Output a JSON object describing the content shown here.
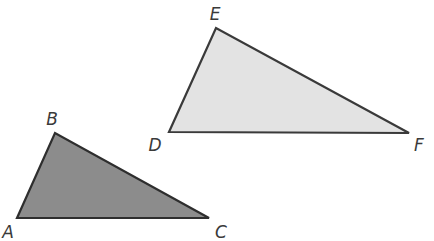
{
  "diagram": {
    "triangles": [
      {
        "name": "ABC",
        "fill": "#8c8c8c",
        "stroke": "#2e2e2e",
        "vertices": [
          {
            "label": "A",
            "x": 17,
            "y": 218,
            "lx": 8,
            "ly": 238,
            "anchor": "middle"
          },
          {
            "label": "B",
            "x": 55,
            "y": 133,
            "lx": 52,
            "ly": 125,
            "anchor": "middle"
          },
          {
            "label": "C",
            "x": 209,
            "y": 218,
            "lx": 221,
            "ly": 238,
            "anchor": "middle"
          }
        ]
      },
      {
        "name": "DEF",
        "fill": "#e3e3e3",
        "stroke": "#3a3a3a",
        "vertices": [
          {
            "label": "D",
            "x": 169,
            "y": 132,
            "lx": 155,
            "ly": 151,
            "anchor": "middle"
          },
          {
            "label": "E",
            "x": 216,
            "y": 28,
            "lx": 215,
            "ly": 20,
            "anchor": "middle"
          },
          {
            "label": "F",
            "x": 409,
            "y": 133,
            "lx": 419,
            "ly": 151,
            "anchor": "middle"
          }
        ]
      }
    ]
  }
}
